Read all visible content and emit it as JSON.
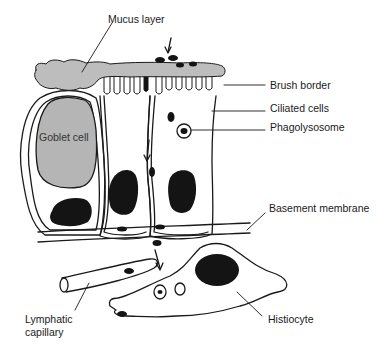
{
  "diagram": {
    "title": "",
    "colors": {
      "mucus": "#bdbdbd",
      "goblet": "#b5b5b5",
      "nucleus": "#141414",
      "stroke": "#1a1a1a",
      "background": "#ffffff"
    },
    "labels": {
      "mucus_layer": "Mucus layer",
      "brush_border": "Brush border",
      "ciliated_cells": "Ciliated cells",
      "phagolysosome": "Phagolysosome",
      "goblet_cell": "Goblet cell",
      "basement_membrane": "Basement membrane",
      "lymphatic_capillary_line1": "Lymphatic",
      "lymphatic_capillary_line2": "capillary",
      "histiocyte": "Histiocyte"
    }
  }
}
